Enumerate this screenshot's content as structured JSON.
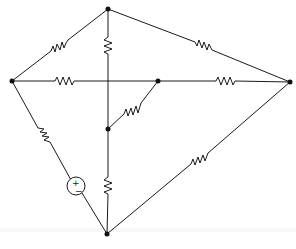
{
  "diagram": {
    "type": "electrical-circuit",
    "colors": {
      "line": "#1a1a1a",
      "node": "#111111",
      "background": "#ffffff"
    },
    "nodes": [
      {
        "id": "top",
        "x": 108,
        "y": 9
      },
      {
        "id": "left",
        "x": 12,
        "y": 81
      },
      {
        "id": "right",
        "x": 290,
        "y": 82
      },
      {
        "id": "bottom",
        "x": 107,
        "y": 234
      },
      {
        "id": "mid-right",
        "x": 158,
        "y": 81
      },
      {
        "id": "mid-inner",
        "x": 108,
        "y": 129
      }
    ],
    "components": [
      {
        "id": "R-left-top",
        "type": "resistor",
        "from": "left",
        "to": "top"
      },
      {
        "id": "R-top-right",
        "type": "resistor",
        "from": "top",
        "to": "right"
      },
      {
        "id": "R-top-vertical",
        "type": "resistor",
        "from": "top",
        "to": "mid-inner"
      },
      {
        "id": "R-left-horizontal",
        "type": "resistor",
        "from": "left",
        "to": "mid-right"
      },
      {
        "id": "R-midright-right",
        "type": "resistor",
        "from": "mid-right",
        "to": "right"
      },
      {
        "id": "R-diagonal-inner",
        "type": "resistor",
        "from": "mid-inner",
        "to": "mid-right"
      },
      {
        "id": "R-left-source",
        "type": "resistor",
        "from": "left",
        "to": "source"
      },
      {
        "id": "V-source",
        "type": "voltage-source",
        "polarity": {
          "plus": "+",
          "minus": "−"
        },
        "from": "left",
        "to": "bottom"
      },
      {
        "id": "R-inner-bottom",
        "type": "resistor",
        "from": "mid-inner",
        "to": "bottom"
      },
      {
        "id": "R-bottom-right",
        "type": "resistor",
        "from": "bottom",
        "to": "right"
      }
    ],
    "source": {
      "plus_label": "+",
      "minus_label": "−"
    }
  }
}
